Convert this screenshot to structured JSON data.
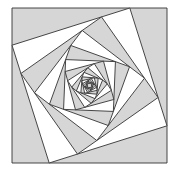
{
  "figure": {
    "outer_square": {
      "x": 12,
      "y": 8,
      "size": 155
    },
    "step_fraction": 0.24,
    "levels": 16,
    "colors": {
      "background": "#ffffff",
      "shade": "#d6d6d6",
      "light": "#ffffff",
      "stroke": "#333333"
    },
    "stroke_width": 0.9
  }
}
